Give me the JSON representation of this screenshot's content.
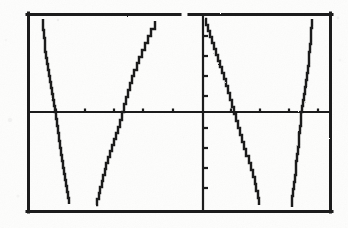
{
  "image": {
    "kind": "graphing-calculator-screen-scan",
    "width": 348,
    "height": 228,
    "background_color": "#fdfdfc",
    "ink_color": "#1a1a1a"
  },
  "screen": {
    "frame": {
      "x": 27,
      "y": 13,
      "width": 305,
      "height": 200,
      "stroke_color": "#1a1a1a",
      "stroke_width": 3,
      "top_border_gap": {
        "x1": 180,
        "x2": 189
      }
    },
    "x_axis": {
      "y": 112,
      "x1": 28,
      "x2": 331,
      "stroke_width": 2,
      "tick_length": 3,
      "tick_positions_x": [
        56,
        85,
        114,
        143,
        173,
        202,
        231,
        260,
        289,
        318
      ]
    },
    "y_axis": {
      "x": 203,
      "y1": 16,
      "y2": 210,
      "stroke_width": 2,
      "tick_length": 4,
      "tick_positions_y": [
        36,
        56,
        76,
        96,
        128,
        148,
        168,
        188
      ]
    }
  },
  "chart_data": {
    "type": "line",
    "title": "",
    "subtitle": "",
    "xlabel": "",
    "ylabel": "",
    "grid": false,
    "legend": "none",
    "xlim": [
      -6.28,
      6.28
    ],
    "ylim": [
      -3.1,
      3.1
    ],
    "series": [
      {
        "name": "branch-1-descending",
        "direction": "descending",
        "points_px": [
          [
            43,
            19
          ],
          [
            43,
            30
          ],
          [
            44,
            38
          ],
          [
            45,
            45
          ],
          [
            45,
            52
          ],
          [
            46,
            58
          ],
          [
            47,
            64
          ],
          [
            48,
            70
          ],
          [
            49,
            76
          ],
          [
            50,
            82
          ],
          [
            51,
            88
          ],
          [
            52,
            94
          ],
          [
            53,
            100
          ],
          [
            54,
            106
          ],
          [
            55,
            112
          ],
          [
            56,
            119
          ],
          [
            57,
            126
          ],
          [
            58,
            133
          ],
          [
            59,
            141
          ],
          [
            60,
            148
          ],
          [
            61,
            155
          ],
          [
            62,
            161
          ],
          [
            63,
            168
          ],
          [
            64,
            174
          ],
          [
            65,
            180
          ],
          [
            66,
            186
          ],
          [
            67,
            192
          ],
          [
            68,
            198
          ],
          [
            69,
            204
          ]
        ]
      },
      {
        "name": "branch-2-ascending",
        "direction": "ascending",
        "points_px": [
          [
            96,
            205
          ],
          [
            97,
            199
          ],
          [
            99,
            193
          ],
          [
            100,
            187
          ],
          [
            102,
            181
          ],
          [
            103,
            175
          ],
          [
            105,
            169
          ],
          [
            106,
            163
          ],
          [
            108,
            157
          ],
          [
            110,
            151
          ],
          [
            112,
            145
          ],
          [
            114,
            139
          ],
          [
            116,
            133
          ],
          [
            118,
            127
          ],
          [
            120,
            120
          ],
          [
            122,
            112
          ],
          [
            124,
            104
          ],
          [
            126,
            97
          ],
          [
            128,
            90
          ],
          [
            130,
            83
          ],
          [
            132,
            76
          ],
          [
            134,
            70
          ],
          [
            137,
            63
          ],
          [
            139,
            57
          ],
          [
            142,
            50
          ],
          [
            145,
            43
          ],
          [
            148,
            36
          ],
          [
            151,
            29
          ],
          [
            155,
            21
          ]
        ]
      },
      {
        "name": "branch-3-descending",
        "direction": "descending",
        "points_px": [
          [
            205,
            19
          ],
          [
            206,
            25
          ],
          [
            208,
            31
          ],
          [
            210,
            37
          ],
          [
            212,
            43
          ],
          [
            214,
            49
          ],
          [
            216,
            55
          ],
          [
            218,
            61
          ],
          [
            220,
            67
          ],
          [
            222,
            73
          ],
          [
            224,
            79
          ],
          [
            226,
            86
          ],
          [
            228,
            93
          ],
          [
            230,
            100
          ],
          [
            232,
            107
          ],
          [
            234,
            114
          ],
          [
            236,
            121
          ],
          [
            238,
            128
          ],
          [
            240,
            135
          ],
          [
            242,
            142
          ],
          [
            244,
            149
          ],
          [
            246,
            156
          ],
          [
            249,
            163
          ],
          [
            251,
            170
          ],
          [
            253,
            177
          ],
          [
            255,
            184
          ],
          [
            256,
            191
          ],
          [
            258,
            198
          ],
          [
            259,
            205
          ]
        ]
      },
      {
        "name": "branch-4-descending-steep",
        "direction": "descending",
        "points_px": [
          [
            312,
            19
          ],
          [
            312,
            28
          ],
          [
            311,
            36
          ],
          [
            311,
            44
          ],
          [
            310,
            52
          ],
          [
            309,
            59
          ],
          [
            309,
            66
          ],
          [
            308,
            73
          ],
          [
            307,
            80
          ],
          [
            306,
            87
          ],
          [
            305,
            94
          ],
          [
            304,
            100
          ],
          [
            303,
            106
          ],
          [
            302,
            112
          ],
          [
            301,
            119
          ],
          [
            301,
            126
          ],
          [
            300,
            133
          ],
          [
            299,
            140
          ],
          [
            299,
            147
          ],
          [
            298,
            154
          ],
          [
            297,
            161
          ],
          [
            296,
            168
          ],
          [
            296,
            175
          ],
          [
            295,
            182
          ],
          [
            294,
            189
          ],
          [
            293,
            196
          ],
          [
            292,
            202
          ],
          [
            292,
            207
          ]
        ]
      }
    ]
  }
}
